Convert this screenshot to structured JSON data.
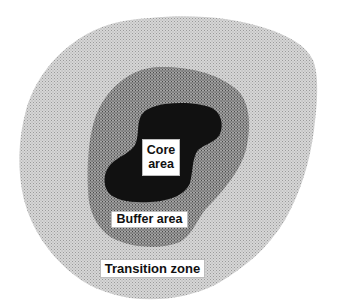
{
  "diagram": {
    "zones": [
      {
        "id": "transition",
        "label": "Transition zone",
        "fill": "#c9c9c9"
      },
      {
        "id": "buffer",
        "label": "Buffer area",
        "fill": "#8c8c8c"
      },
      {
        "id": "core",
        "label_line1": "Core",
        "label_line2": "area",
        "fill": "#111111"
      }
    ],
    "labels": {
      "core_line1": "Core",
      "core_line2": "area",
      "buffer": "Buffer area",
      "transition": "Transition zone"
    }
  }
}
